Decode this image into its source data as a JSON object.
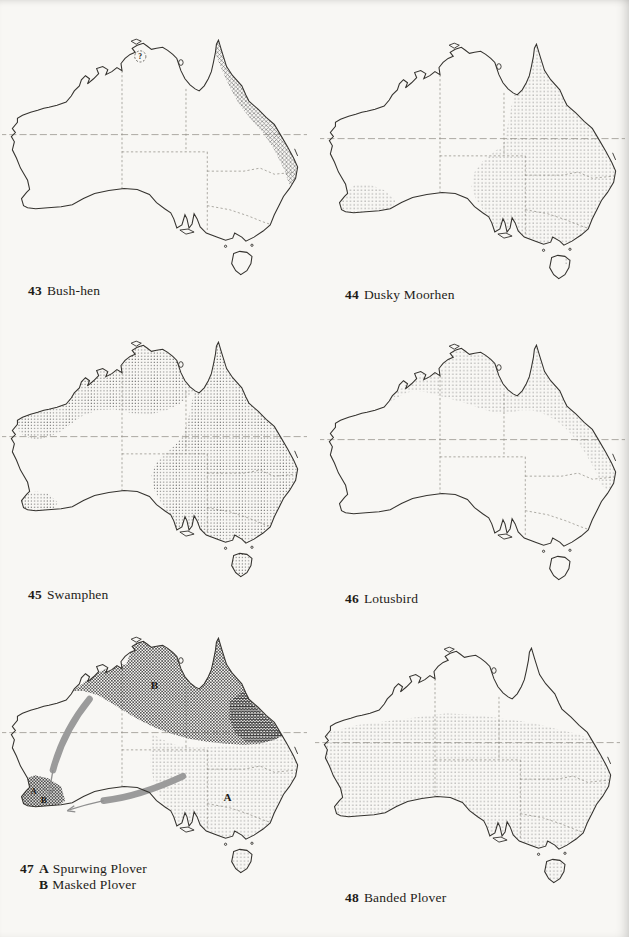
{
  "page": {
    "background": "#f8f7f4",
    "ink": "#2b2925"
  },
  "legend_colors": {
    "range_dots_light": "#6f6f6f",
    "range_hatch": "#6a6a6a",
    "range_dark_cross": "#4a4a4a",
    "migration_arrow": "#9b9b9b",
    "coastline": "#35332f"
  },
  "figures": [
    {
      "number": "43",
      "name": "Bush-hen",
      "uncertain_marker": "?"
    },
    {
      "number": "44",
      "name": "Dusky Moorhen"
    },
    {
      "number": "45",
      "name": "Swamphen"
    },
    {
      "number": "46",
      "name": "Lotusbird"
    },
    {
      "number": "47",
      "entries": [
        {
          "letter": "A",
          "name": "Spurwing Plover"
        },
        {
          "letter": "B",
          "name": "Masked Plover"
        }
      ],
      "region_labels": {
        "north": "B",
        "east": "A",
        "southwest_top": "A",
        "southwest_bottom": "B"
      }
    },
    {
      "number": "48",
      "name": "Banded Plover"
    }
  ]
}
